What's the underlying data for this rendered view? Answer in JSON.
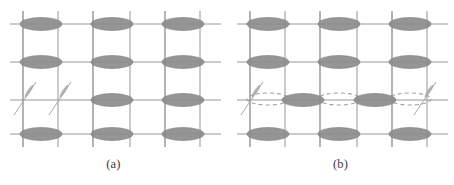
{
  "figure": {
    "type": "diagram",
    "background_color": "#ffffff",
    "width": 454,
    "height": 185,
    "colors": {
      "grid_line": "#9a9a9a",
      "grid_line_strong": "#8e8e8e",
      "ellipse_fill": "#8d8d8d",
      "ellipse_stroke": "#7a7a7a",
      "dashed_outline": "#a0a0a0",
      "slip_line": "#a8a8a8",
      "caption_text": "#3a3a3a"
    },
    "panels": [
      {
        "id": "a",
        "caption": "(a)",
        "origin_x": 0,
        "grid": {
          "column_x": [
            23,
            58,
            93,
            130,
            165,
            200
          ],
          "row_y": [
            24,
            62,
            100,
            134
          ],
          "h_line_x_start": 10,
          "h_line_x_end": 221,
          "v_line_y_start": 11,
          "v_line_y_end": 147
        },
        "ellipses": [
          {
            "cx": 41,
            "cy": 24,
            "rx": 21,
            "ry": 6.5,
            "style": "solid"
          },
          {
            "cx": 112,
            "cy": 24,
            "rx": 21,
            "ry": 6.5,
            "style": "solid"
          },
          {
            "cx": 183,
            "cy": 24,
            "rx": 21,
            "ry": 6.5,
            "style": "solid"
          },
          {
            "cx": 41,
            "cy": 62,
            "rx": 21,
            "ry": 6.5,
            "style": "solid"
          },
          {
            "cx": 112,
            "cy": 62,
            "rx": 21,
            "ry": 6.5,
            "style": "solid"
          },
          {
            "cx": 183,
            "cy": 62,
            "rx": 21,
            "ry": 6.5,
            "style": "solid"
          },
          {
            "cx": 112,
            "cy": 100,
            "rx": 21,
            "ry": 6.5,
            "style": "solid"
          },
          {
            "cx": 183,
            "cy": 100,
            "rx": 21,
            "ry": 6.5,
            "style": "solid"
          },
          {
            "cx": 41,
            "cy": 134,
            "rx": 21,
            "ry": 6.5,
            "style": "solid"
          },
          {
            "cx": 112,
            "cy": 134,
            "rx": 21,
            "ry": 6.5,
            "style": "solid"
          },
          {
            "cx": 183,
            "cy": 134,
            "rx": 21,
            "ry": 6.5,
            "style": "solid"
          }
        ],
        "slip_marks": [
          {
            "x1": 14,
            "y1": 115,
            "x2": 36,
            "y2": 82,
            "label": "slip-line-left"
          },
          {
            "x1": 49,
            "y1": 115,
            "x2": 71,
            "y2": 82,
            "label": "slip-line-right"
          }
        ],
        "slip_tapers": [
          {
            "cx": 29,
            "cy": 91,
            "angle": -56,
            "rx": 7.5,
            "ry": 1.6
          },
          {
            "cx": 64,
            "cy": 91,
            "angle": -56,
            "rx": 7.5,
            "ry": 1.6
          }
        ],
        "dashed_ellipses": []
      },
      {
        "id": "b",
        "caption": "(b)",
        "origin_x": 227,
        "grid": {
          "column_x": [
            23,
            58,
            93,
            130,
            165,
            200
          ],
          "row_y": [
            24,
            62,
            100,
            134
          ],
          "h_line_x_start": 10,
          "h_line_x_end": 221,
          "v_line_y_start": 11,
          "v_line_y_end": 147
        },
        "ellipses": [
          {
            "cx": 41,
            "cy": 24,
            "rx": 21,
            "ry": 6.5,
            "style": "solid"
          },
          {
            "cx": 112,
            "cy": 24,
            "rx": 21,
            "ry": 6.5,
            "style": "solid"
          },
          {
            "cx": 183,
            "cy": 24,
            "rx": 21,
            "ry": 6.5,
            "style": "solid"
          },
          {
            "cx": 41,
            "cy": 62,
            "rx": 21,
            "ry": 6.5,
            "style": "solid"
          },
          {
            "cx": 112,
            "cy": 62,
            "rx": 21,
            "ry": 6.5,
            "style": "solid"
          },
          {
            "cx": 183,
            "cy": 62,
            "rx": 21,
            "ry": 6.5,
            "style": "solid"
          },
          {
            "cx": 76,
            "cy": 100,
            "rx": 21,
            "ry": 6.5,
            "style": "solid"
          },
          {
            "cx": 148,
            "cy": 100,
            "rx": 21,
            "ry": 6.5,
            "style": "solid"
          },
          {
            "cx": 41,
            "cy": 134,
            "rx": 21,
            "ry": 6.5,
            "style": "solid"
          },
          {
            "cx": 112,
            "cy": 134,
            "rx": 21,
            "ry": 6.5,
            "style": "solid"
          },
          {
            "cx": 183,
            "cy": 134,
            "rx": 21,
            "ry": 6.5,
            "style": "solid"
          }
        ],
        "dashed_ellipses": [
          {
            "cx": 41,
            "cy": 99,
            "rx": 21,
            "ry": 6.0
          },
          {
            "cx": 112,
            "cy": 99,
            "rx": 21,
            "ry": 6.0
          },
          {
            "cx": 183,
            "cy": 99,
            "rx": 21,
            "ry": 6.0
          }
        ],
        "slip_marks": [
          {
            "x1": 14,
            "y1": 115,
            "x2": 36,
            "y2": 82,
            "label": "slip-line-left"
          },
          {
            "x1": 187,
            "y1": 115,
            "x2": 209,
            "y2": 82,
            "label": "slip-line-right"
          }
        ],
        "slip_tapers": [
          {
            "cx": 29,
            "cy": 91,
            "angle": -56,
            "rx": 7.5,
            "ry": 1.6
          },
          {
            "cx": 202,
            "cy": 91,
            "angle": -56,
            "rx": 7.5,
            "ry": 1.6
          }
        ]
      }
    ]
  }
}
